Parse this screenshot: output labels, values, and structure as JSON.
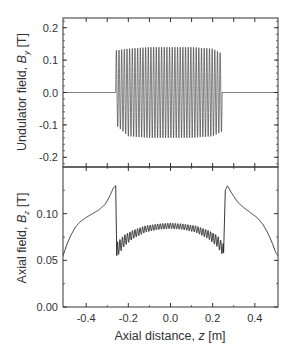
{
  "chart_data": [
    {
      "panel": "top",
      "type": "line",
      "title": "",
      "xlabel": "",
      "ylabel": "Undulator field, B_y [T]",
      "ylabel_parts": {
        "prefix": "Undulator field, ",
        "symbol": "B",
        "sub": "y",
        "suffix": " [T]"
      },
      "xlim": [
        -0.51,
        0.51
      ],
      "ylim": [
        -0.23,
        0.23
      ],
      "yticks": [
        -0.2,
        -0.1,
        0.0,
        0.1,
        0.2
      ],
      "ytick_labels": [
        "-0.2",
        "-0.1",
        "0.0",
        "0.1",
        "0.2"
      ],
      "xticks": [
        -0.4,
        -0.3,
        -0.2,
        -0.1,
        0.0,
        0.1,
        0.2,
        0.3,
        0.4
      ],
      "grid": false,
      "description": "Flat 0 T outside undulator; sinusoidal oscillation between z≈-0.26 and z≈0.245 m with amplitude ≈0.13–0.14 T (about 40 periods), slightly tapering at ends",
      "series": [
        {
          "name": "B_y",
          "x": [
            -0.51,
            -0.27,
            -0.26,
            -0.2,
            -0.1,
            0.0,
            0.1,
            0.2,
            0.245,
            0.25,
            0.51
          ],
          "envelope_max": [
            0.0,
            0.0,
            0.13,
            0.135,
            0.14,
            0.14,
            0.14,
            0.135,
            0.12,
            0.0,
            0.0
          ],
          "envelope_min": [
            0.0,
            0.0,
            -0.1,
            -0.135,
            -0.14,
            -0.14,
            -0.14,
            -0.135,
            -0.12,
            0.0,
            0.0
          ],
          "periods": 40,
          "z_start": -0.26,
          "z_end": 0.245
        }
      ]
    },
    {
      "panel": "bottom",
      "type": "line",
      "title": "",
      "xlabel": "Axial distance, z [m]",
      "xlabel_parts": {
        "prefix": "Axial distance, ",
        "symbol": "z",
        "suffix": " [m]"
      },
      "ylabel": "Axial field, B_z [T]",
      "ylabel_parts": {
        "prefix": "Axial  field, ",
        "symbol": "B",
        "sub": "z",
        "suffix": " [T]"
      },
      "xlim": [
        -0.51,
        0.51
      ],
      "ylim": [
        0.0,
        0.15
      ],
      "xticks": [
        -0.4,
        -0.2,
        0.0,
        0.2,
        0.4
      ],
      "xtick_labels": [
        "-0.4",
        "-0.2",
        "0.0",
        "0.2",
        "0.4"
      ],
      "yticks": [
        0.0,
        0.05,
        0.1
      ],
      "ytick_labels": [
        "0.00",
        "0.05",
        "0.10"
      ],
      "grid": false,
      "series": [
        {
          "name": "B_z outer (left)",
          "x": [
            -0.51,
            -0.49,
            -0.47,
            -0.45,
            -0.43,
            -0.4,
            -0.37,
            -0.34,
            -0.31,
            -0.29,
            -0.27,
            -0.26,
            -0.255
          ],
          "y": [
            0.055,
            0.068,
            0.078,
            0.086,
            0.091,
            0.096,
            0.1,
            0.104,
            0.11,
            0.118,
            0.128,
            0.13,
            0.12
          ]
        },
        {
          "name": "B_z inner band (max)",
          "x": [
            -0.25,
            -0.22,
            -0.18,
            -0.12,
            -0.06,
            0.0,
            0.06,
            0.12,
            0.18,
            0.22,
            0.25
          ],
          "y": [
            0.07,
            0.077,
            0.082,
            0.087,
            0.089,
            0.09,
            0.089,
            0.087,
            0.082,
            0.077,
            0.068
          ]
        },
        {
          "name": "B_z inner band (min)",
          "x": [
            -0.25,
            -0.22,
            -0.18,
            -0.12,
            -0.06,
            0.0,
            0.06,
            0.12,
            0.18,
            0.22,
            0.25
          ],
          "y": [
            0.055,
            0.065,
            0.073,
            0.08,
            0.083,
            0.084,
            0.083,
            0.08,
            0.073,
            0.065,
            0.055
          ]
        },
        {
          "name": "B_z outer (right)",
          "x": [
            0.255,
            0.26,
            0.27,
            0.29,
            0.32,
            0.35,
            0.38,
            0.41,
            0.44,
            0.46,
            0.48,
            0.5,
            0.51
          ],
          "y": [
            0.06,
            0.125,
            0.13,
            0.122,
            0.112,
            0.106,
            0.101,
            0.096,
            0.088,
            0.08,
            0.07,
            0.058,
            0.055
          ]
        }
      ]
    }
  ]
}
